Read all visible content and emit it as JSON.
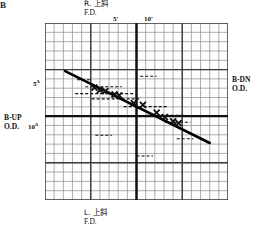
{
  "panel_label": "B",
  "labels": {
    "top_line1": "R. 上斜",
    "top_line2": "F.D.",
    "bottom_line1": "L. 上斜",
    "bottom_line2": "F.D.",
    "right_line1": "B-DN",
    "right_line2": "O.D.",
    "left_line1": "B-UP",
    "left_line2": "O.D."
  },
  "ticks": {
    "top_5": "5'",
    "top_10": "10'",
    "bottom_5": "5'",
    "bottom_10": "10'",
    "left_5": "5",
    "left_5_sup": "Δ",
    "left_10": "10",
    "left_10_sup": "Δ",
    "right_5": "5",
    "right_5_sup": "Δ",
    "right_10": "10",
    "right_10_sup": "Δ"
  },
  "colors": {
    "grid_minor": "#8c8c8c",
    "grid_major": "#3a3a3a",
    "axis": "#111111",
    "data": "#111111",
    "fit_line": "#000000"
  },
  "chart_data": {
    "type": "scatter",
    "title": "",
    "xlabel": "Gaze direction (prism dioptres / arc)",
    "ylabel": "Vertical deviation (prism dioptres)",
    "xlim": [
      -10,
      10
    ],
    "ylim": [
      -10,
      10
    ],
    "grid": true,
    "legend": null,
    "axis_labels": {
      "top": "R. 上斜 F.D.",
      "bottom": "L. 上斜 F.D.",
      "left": "B-UP O.D.",
      "right": "B-DN O.D."
    },
    "series": [
      {
        "name": "measurements",
        "marker": "x",
        "points": [
          {
            "x": -4.6,
            "y": 3.3
          },
          {
            "x": -4.0,
            "y": 3.0
          },
          {
            "x": -3.4,
            "y": 2.9
          },
          {
            "x": -2.4,
            "y": 2.5
          },
          {
            "x": -1.9,
            "y": 2.4
          },
          {
            "x": -0.3,
            "y": 1.5
          },
          {
            "x": 0.7,
            "y": 1.3
          },
          {
            "x": 2.2,
            "y": 0.4
          },
          {
            "x": 3.1,
            "y": -0.1
          },
          {
            "x": 4.0,
            "y": -0.6
          },
          {
            "x": 4.6,
            "y": -0.8
          }
        ]
      },
      {
        "name": "regression-line",
        "type": "line",
        "points": [
          {
            "x": -7.8,
            "y": 5.2
          },
          {
            "x": 8.0,
            "y": -3.1
          }
        ]
      }
    ],
    "error_bars": [
      {
        "x": -5.7,
        "y": 4.2,
        "half_width": 0.8
      },
      {
        "x": -3.6,
        "y": 3.4,
        "half_width": 2.0
      },
      {
        "x": -3.5,
        "y": 2.6,
        "half_width": 3.2
      },
      {
        "x": -2.3,
        "y": 2.0,
        "half_width": 2.6
      },
      {
        "x": 1.0,
        "y": 1.1,
        "half_width": 2.4
      },
      {
        "x": 3.2,
        "y": 0.1,
        "half_width": 2.2
      },
      {
        "x": 4.5,
        "y": -0.7,
        "half_width": 1.4
      },
      {
        "x": 1.3,
        "y": 4.6,
        "half_width": 0.9
      },
      {
        "x": -3.6,
        "y": -2.2,
        "half_width": 0.9
      },
      {
        "x": 0.9,
        "y": -4.6,
        "half_width": 0.9
      },
      {
        "x": 5.3,
        "y": -2.6,
        "half_width": 0.9
      }
    ]
  }
}
